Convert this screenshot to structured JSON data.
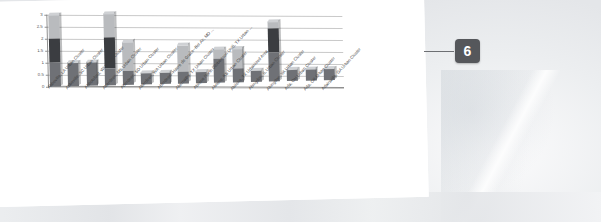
{
  "panel": {
    "name": "slide-panel"
  },
  "callout": {
    "badge_label": "6",
    "badge_color": "#55575b",
    "leader_color": "#6d6f73"
  },
  "chart_data": {
    "type": "bar",
    "subtype": "stacked-3d-column",
    "title": "",
    "subtitle": "",
    "xlabel": "",
    "ylabel": "",
    "ylim": [
      0,
      3
    ],
    "grid": true,
    "legend": "none",
    "ytick_labels": [
      "0",
      "0.5",
      "1",
      "1.5",
      "2",
      "2.5",
      "3"
    ],
    "ytick_values": [
      0,
      0.5,
      1,
      1.5,
      2,
      2.5,
      3
    ],
    "categories": [
      "Abbeville, LA Urban Cluster",
      "Abbeville, SC Urban Cluster",
      "Abbotsford, WI Urban Cluster",
      "Aberdeen, MS Urban Cluster",
      "Aberdeen, SD Urban Cluster",
      "Aberdeen, WA Urban Cluster",
      "Aberdeen--Havre de Grace--Bel Air, MD ...",
      "Abernathy, TX Urban Cluster",
      "Abilene North (Robertson Unit), TX Urban ...",
      "Abilene, KS Urban Cluster",
      "Abilene, TX Urbanized Area",
      "Abingdon, IL Urban Cluster",
      "Abingdon, VA Urban Cluster",
      "Ada, OH Urban Cluster",
      "Ada, OK Urban Cluster",
      "Adairsville, GA Urban Cluster"
    ],
    "series": [
      {
        "name": "Series 1",
        "color": "#6f7176",
        "values": [
          1.0,
          1.0,
          1.0,
          0.7,
          0.6,
          0.5,
          0.5,
          0.5,
          0.5,
          1.0,
          0.6,
          0.5,
          1.2,
          0.5,
          0.5,
          0.5
        ]
      },
      {
        "name": "Series 2",
        "color": "#3b3d41",
        "values": [
          1.0,
          0.0,
          0.0,
          1.3,
          0.0,
          0.0,
          0.0,
          0.0,
          0.0,
          0.0,
          0.0,
          0.0,
          1.0,
          0.0,
          0.0,
          0.0
        ]
      },
      {
        "name": "Series 3",
        "color": "#b9bbbe",
        "values": [
          1.0,
          0.0,
          0.0,
          1.0,
          1.2,
          0.0,
          0.0,
          1.1,
          0.0,
          0.4,
          0.8,
          0.0,
          0.3,
          0.0,
          0.0,
          0.0
        ]
      }
    ],
    "totals": [
      3.0,
      1.0,
      1.0,
      3.0,
      1.8,
      0.5,
      0.5,
      1.6,
      0.5,
      1.4,
      1.4,
      0.5,
      2.5,
      0.5,
      0.5,
      0.5
    ]
  }
}
